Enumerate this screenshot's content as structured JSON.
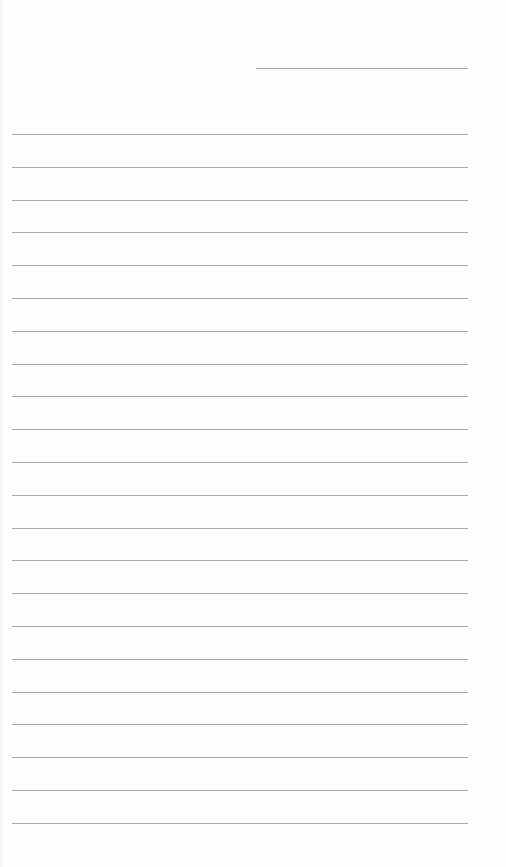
{
  "page": {
    "type": "lined-notebook-paper",
    "background_color": "#fefefe",
    "line_color": "#aaaaaa",
    "header_line": {
      "label": "date-line",
      "x_start": 256,
      "x_end": 468,
      "y": 68
    },
    "ruled_lines": {
      "count": 22,
      "x_start": 12,
      "x_end": 468,
      "first_y": 134,
      "spacing": 32.8
    }
  }
}
